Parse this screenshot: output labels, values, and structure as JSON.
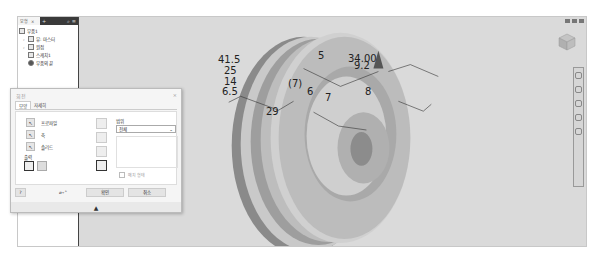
{
  "browser": {
    "tab_model": "모형",
    "close": "×",
    "add": "+",
    "tree": [
      {
        "label": "부품1",
        "icon": "part-icon"
      },
      {
        "label": "뷰: 마스터",
        "icon": "view-icon"
      },
      {
        "label": "원점",
        "icon": "folder-icon"
      },
      {
        "label": "스케치1",
        "icon": "sketch-icon"
      },
      {
        "label": "부품의 끝",
        "icon": "end-of-part-icon"
      }
    ]
  },
  "dimensions": [
    {
      "text": "41.5",
      "x": 200,
      "y": 54
    },
    {
      "text": "25",
      "x": 206,
      "y": 65
    },
    {
      "text": "14",
      "x": 206,
      "y": 76
    },
    {
      "text": "6.5",
      "x": 204,
      "y": 86
    },
    {
      "text": "(7)",
      "x": 270,
      "y": 78
    },
    {
      "text": "6",
      "x": 289,
      "y": 86
    },
    {
      "text": "7",
      "x": 307,
      "y": 92
    },
    {
      "text": "29",
      "x": 248,
      "y": 106
    },
    {
      "text": "5",
      "x": 300,
      "y": 50
    },
    {
      "text": "34.00",
      "x": 330,
      "y": 53
    },
    {
      "text": "9.2",
      "x": 336,
      "y": 60
    },
    {
      "text": "8",
      "x": 347,
      "y": 86
    }
  ],
  "dialog": {
    "title": "회전",
    "close": "×",
    "tabs": [
      "모양",
      "자세히"
    ],
    "profile_label": "프로파일",
    "axis_label": "축",
    "solid_label": "솔리드",
    "output_label": "출력",
    "extent_label": "범위",
    "extent_value": "전체",
    "match_shape_label": "매치 형태",
    "ok_label": "확인",
    "cancel_label": "취소"
  }
}
